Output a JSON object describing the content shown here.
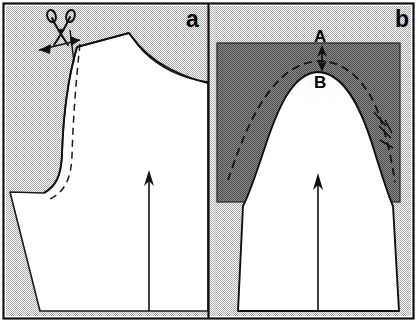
{
  "figure": {
    "width": 417,
    "height": 322,
    "background_color": "#ffffff",
    "frame_color": "#000000"
  },
  "colors": {
    "stipple_light": "#d9d9d9",
    "stipple_dark": "#9a9a9a",
    "paper_white": "#ffffff",
    "ink": "#000000",
    "dashed_ink": "#1a1a1a"
  },
  "panels": [
    {
      "id": "panel-a",
      "label": "a",
      "label_position": {
        "x": 186,
        "y": 27
      },
      "description": "Sleeve pattern piece with slash line marked for cutting; scissors icon and double-headed width arrow at the cap seam.",
      "background": "stipple_light",
      "annotations": {
        "scissors": {
          "name": "scissors-icon",
          "x": 48,
          "y": 14
        },
        "width_arrow": {
          "name": "double-headed-arrow",
          "from_x": 38,
          "from_y": 50,
          "to_x": 80,
          "to_y": 41
        },
        "dashed_line": {
          "name": "alteration-dashed-line"
        },
        "grainline_arrow": {
          "name": "grainline-arrow",
          "x": 149,
          "y_top": 172,
          "y_bottom": 310
        }
      }
    },
    {
      "id": "panel-b",
      "label": "b",
      "label_position": {
        "x": 395,
        "y": 27
      },
      "description": "Sleeve cap overlaid with shaded block; dashed line shows raised cap line A above original cap point B.",
      "background": "stipple_light",
      "overlay_block": {
        "name": "shaded-overlay-block",
        "fill": "stipple_dark",
        "x": 217,
        "y": 43,
        "width": 183,
        "height": 159
      },
      "annotations": {
        "label_a": {
          "text": "A",
          "x": 314,
          "y": 42
        },
        "label_b": {
          "text": "B",
          "x": 314,
          "y": 87
        },
        "rise_arrow": {
          "name": "cap-rise-double-arrow",
          "x": 322,
          "y_top": 49,
          "y_bottom": 66
        },
        "dashed_curve": {
          "name": "raised-cap-dashed-curve"
        },
        "tick_marks": {
          "name": "notch-tick-marks",
          "x": 382,
          "y": 115
        },
        "grainline_arrow": {
          "name": "grainline-arrow",
          "x": 318,
          "y_top": 175,
          "y_bottom": 310
        }
      }
    }
  ],
  "legend": {
    "point_a_meaning": "A",
    "point_b_meaning": "B"
  }
}
